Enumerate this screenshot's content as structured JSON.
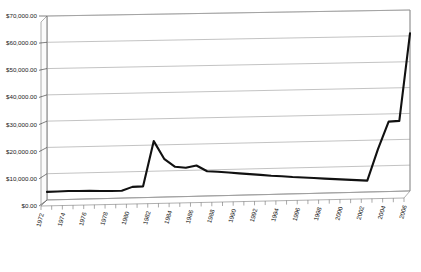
{
  "chart_data": {
    "type": "line",
    "title": "",
    "subtitle": "",
    "xlabel": "",
    "ylabel": "",
    "ylim": [
      0,
      70000
    ],
    "ytick_values": [
      0,
      10000,
      20000,
      30000,
      40000,
      50000,
      60000,
      70000
    ],
    "ytick_labels": [
      "$0.00",
      "$10,000.00",
      "$20,000.00",
      "$30,000.00",
      "$40,000.00",
      "$50,000.00",
      "$60,000.00",
      "$70,000.00"
    ],
    "grid": true,
    "grid_axis": "y",
    "legend": false,
    "legend_position": "none",
    "style": "3d-perspective",
    "line_color": "#111111",
    "grid_color": "#9a9a9a",
    "background_color": "#ffffff",
    "xlim": [
      1972,
      2006
    ],
    "x_tick_interval": 1,
    "x_label_interval": 2,
    "xtick_labels": [
      "1972",
      "1974",
      "1976",
      "1978",
      "1980",
      "1982",
      "1984",
      "1986",
      "1988",
      "1990",
      "1992",
      "1994",
      "1996",
      "1998",
      "2000",
      "2002",
      "2004",
      "2006"
    ],
    "x": [
      1972,
      1973,
      1974,
      1975,
      1976,
      1977,
      1978,
      1979,
      1980,
      1981,
      1982,
      1983,
      1984,
      1985,
      1986,
      1987,
      1988,
      1989,
      1990,
      1991,
      1992,
      1993,
      1994,
      1995,
      1996,
      1997,
      1998,
      1999,
      2000,
      2001,
      2002,
      2003,
      2004,
      2005,
      2006
    ],
    "values": [
      3100,
      3150,
      3200,
      3150,
      3100,
      2950,
      2850,
      2800,
      4200,
      4300,
      21500,
      14500,
      11500,
      11000,
      11800,
      9500,
      9200,
      8800,
      8400,
      8000,
      7600,
      7200,
      6900,
      6500,
      6200,
      5900,
      5600,
      5300,
      5000,
      4700,
      4400,
      16500,
      27000,
      27200,
      61000
    ],
    "annotations": [
      {
        "label": "peak",
        "x": 1982,
        "y": 21500
      },
      {
        "label": "plateau",
        "x": 2004,
        "y": 27000
      },
      {
        "label": "final",
        "x": 2006,
        "y": 61000
      }
    ]
  }
}
